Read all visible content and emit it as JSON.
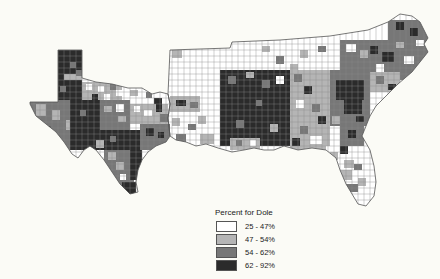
{
  "map": {
    "region": "Southern United States (counties)",
    "background": "#fbfbf6",
    "border_color": "#6a6a6a"
  },
  "legend": {
    "title": "Percent for Dole",
    "classes": [
      {
        "label": "25 - 47%",
        "color": "#ffffff"
      },
      {
        "label": "47 - 54%",
        "color": "#b5b5b5"
      },
      {
        "label": "54 - 62%",
        "color": "#777777"
      },
      {
        "label": "62 - 92%",
        "color": "#2b2b2b"
      }
    ]
  }
}
